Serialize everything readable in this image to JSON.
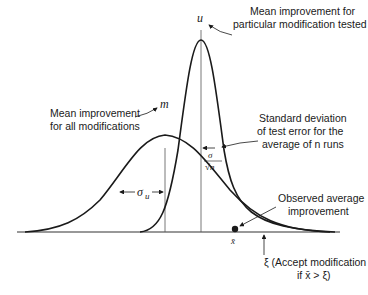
{
  "diagram": {
    "type": "two overlapping normal distributions",
    "symbols": {
      "u": "u",
      "m": "m",
      "sigma_u": "σ",
      "sigma_u_sub": "u",
      "sigma": "σ",
      "sqrt_n": "√n",
      "xbar": "x̄",
      "xi": "ξ"
    },
    "annotations": {
      "u_label": [
        "Mean improvement for",
        "particular modification tested"
      ],
      "m_label": [
        "Mean improvement",
        "for all modifications"
      ],
      "sd_label": [
        "Standard deviation",
        "of test error for the",
        "average of n runs"
      ],
      "observed_label": [
        "Observed average",
        "improvement"
      ],
      "xi_label": [
        "ξ (Accept modification",
        "if x̄ > ξ)"
      ]
    },
    "colors": {
      "ink": "#1a1a1a",
      "background": "#ffffff",
      "guide": "#555555"
    }
  }
}
